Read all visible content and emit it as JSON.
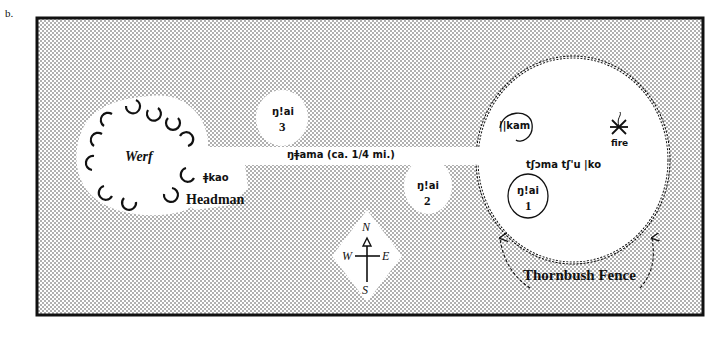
{
  "figure": {
    "panel_label": "b.",
    "colors": {
      "background": "#ffffff",
      "stipple_dot": "#3a3a3a",
      "ink": "#111111"
    }
  },
  "werf": {
    "label": "Werf",
    "hut_count": 14
  },
  "headman": {
    "hut_name": "ǂkao",
    "label": "Headman"
  },
  "path": {
    "label": "ŋǂama  (ca.  1/4  mi.)"
  },
  "huts_outside": [
    {
      "name": "ŋ!ai",
      "number": "3"
    },
    {
      "name": "ŋ!ai",
      "number": "2"
    }
  ],
  "dance_circle": {
    "label": "tʃɔma  tʃ'u  |ko",
    "kam_label": "||kam",
    "fire_label": "fire",
    "hut_inside": {
      "name": "ŋ!ai",
      "number": "1"
    },
    "fence_label": "Thornbush Fence"
  },
  "compass": {
    "north": "N",
    "south": "S",
    "east": "E",
    "west": "W"
  }
}
